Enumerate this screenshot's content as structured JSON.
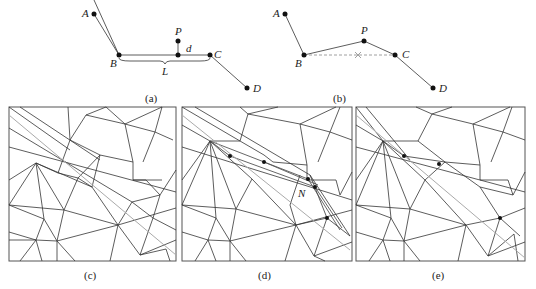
{
  "figure": {
    "panels": [
      {
        "id": "a",
        "caption": "(a)",
        "points": [
          "A",
          "B",
          "P",
          "C",
          "D"
        ],
        "annotations": [
          "d",
          "L"
        ],
        "description": "Polyline A-B-C-D with point P at distance d above segment BC of length L"
      },
      {
        "id": "b",
        "caption": "(b)",
        "points": [
          "A",
          "B",
          "P",
          "C",
          "D"
        ],
        "description": "Polyline A-B-P-C-D with dashed removed segment B-C marked with x"
      },
      {
        "id": "c",
        "caption": "(c)",
        "description": "Triangulated mesh with grey constraint line"
      },
      {
        "id": "d",
        "caption": "(d)",
        "label": "N",
        "description": "Triangulated mesh with inserted constraint edges and point N"
      },
      {
        "id": "e",
        "caption": "(e)",
        "description": "Triangulated mesh after simplification with grey constraint line"
      }
    ]
  },
  "colors": {
    "line": "#333333",
    "constraint": "#aaaaaa",
    "point": "#111111"
  }
}
